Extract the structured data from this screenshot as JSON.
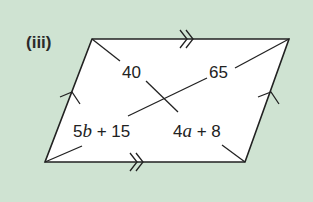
{
  "part_label": "(iii)",
  "shape": "parallelogram",
  "colors": {
    "background": "#cfe3d2",
    "fill": "#ffffff",
    "stroke": "#222222"
  },
  "vertices": {
    "top_left": [
      92,
      39
    ],
    "top_right": [
      289,
      39
    ],
    "bottom_right": [
      245,
      162
    ],
    "bottom_left": [
      45,
      162
    ]
  },
  "parallel_marks": {
    "top_bottom": "double-arrow",
    "left_right": "single-arrow"
  },
  "labels": {
    "upper_left_segment": "40",
    "upper_right_segment": "65",
    "lower_left_segment": {
      "coef": "5",
      "var": "b",
      "rest": " + 15"
    },
    "lower_right_segment": {
      "coef": "4",
      "var": "a",
      "rest": " + 8"
    }
  }
}
